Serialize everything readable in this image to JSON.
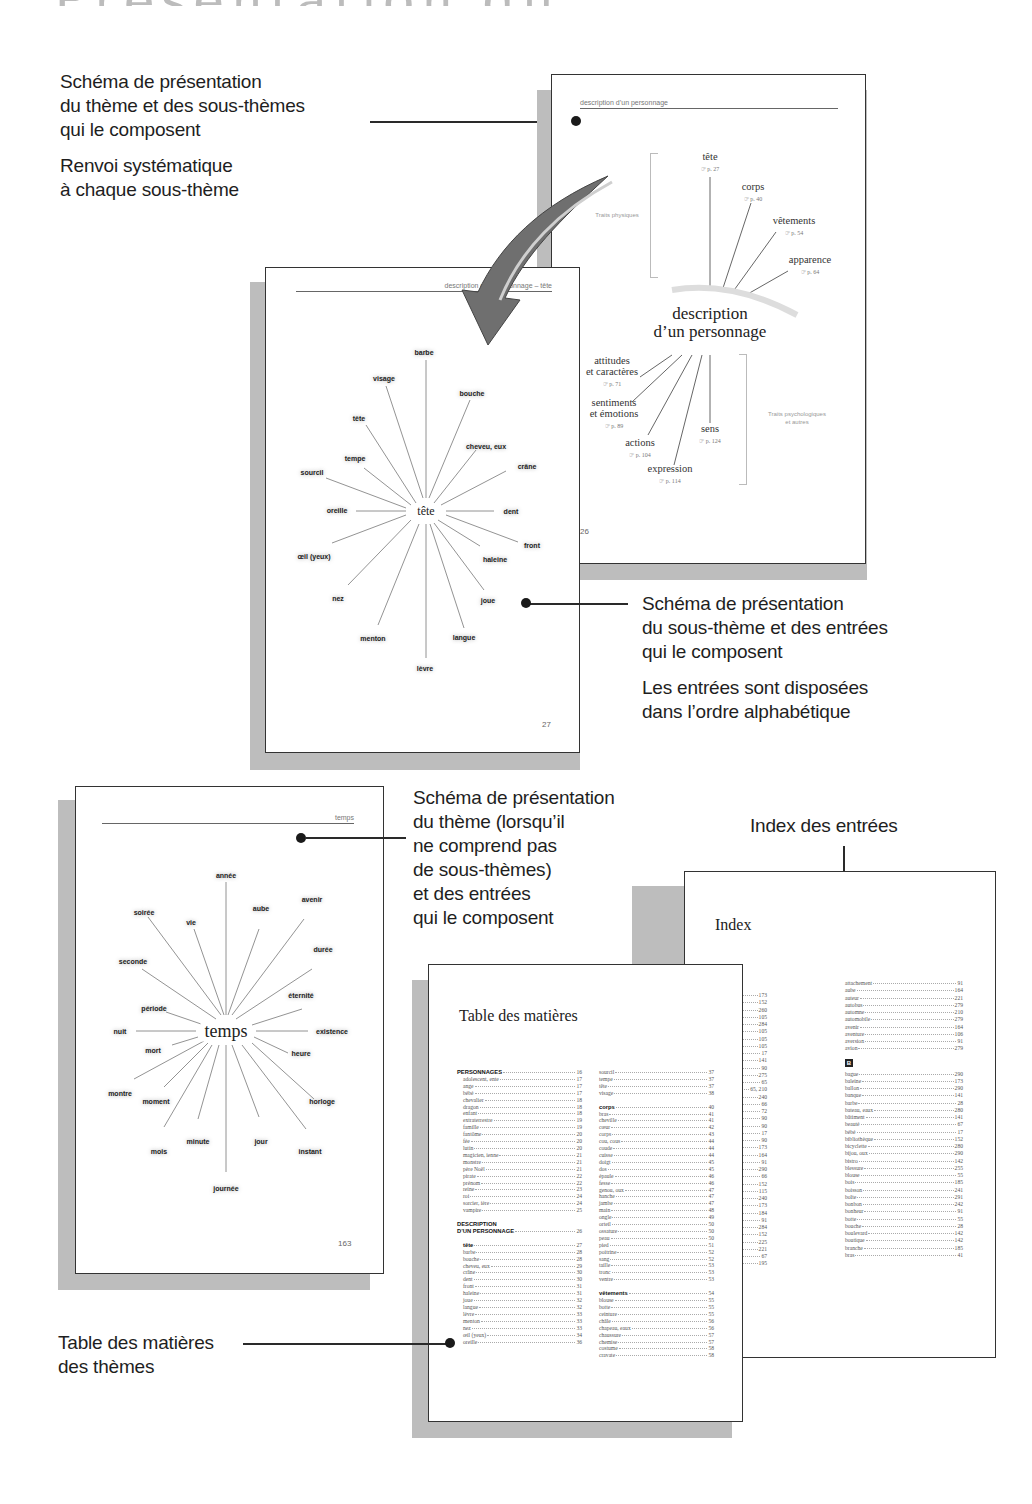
{
  "page_title": "Présentation du thésaurus",
  "captions": {
    "theme_schema": [
      "Schéma de présentation\ndu thème et des sous-thèmes\nqui le composent",
      "Renvoi systématique\nà chaque sous-thème"
    ],
    "subtheme_schema": [
      "Schéma de présentation\ndu sous-thème et des entrées\nqui le composent",
      "Les entrées sont disposées\ndans l’ordre alphabétique"
    ],
    "theme_no_sub": [
      "Schéma de présentation\ndu thème (lorsqu’il\nne comprend pas\nde sous-thèmes)\net des entrées\nqui le composent"
    ],
    "index": "Index des entrées",
    "toc": "Table des matières\ndes thèmes"
  },
  "page_26": {
    "running_head": "description d’un personnage",
    "folio": "26",
    "hub": [
      "description",
      "d’un personnage"
    ],
    "bracket_top": "Traits physiques",
    "bracket_bottom": "Traits psychologiques\net autres",
    "subthemes": [
      {
        "label": "tête",
        "ref": "☞ p. 27"
      },
      {
        "label": "corps",
        "ref": "☞ p. 40"
      },
      {
        "label": "vêtements",
        "ref": "☞ p. 54"
      },
      {
        "label": "apparence",
        "ref": "☞ p. 64"
      },
      {
        "label": "attitudes\net caractères",
        "ref": "☞ p. 71"
      },
      {
        "label": "sentiments\net émotions",
        "ref": "☞ p. 89"
      },
      {
        "label": "actions",
        "ref": "☞ p. 104"
      },
      {
        "label": "expression",
        "ref": "☞ p. 114"
      },
      {
        "label": "sens",
        "ref": "☞ p. 124"
      }
    ]
  },
  "page_27": {
    "running_head": "description d’un personnage – tête",
    "folio": "27",
    "hub": "tête",
    "entries": [
      "barbe",
      "bouche",
      "cheveu, eux",
      "crâne",
      "dent",
      "front",
      "haleine",
      "joue",
      "langue",
      "lèvre",
      "menton",
      "nez",
      "œil (yeux)",
      "oreille",
      "sourcil",
      "tempe",
      "tête",
      "visage"
    ]
  },
  "page_163": {
    "running_head": "temps",
    "folio": "163",
    "hub": "temps",
    "entries": [
      "année",
      "aube",
      "avenir",
      "durée",
      "éternité",
      "existence",
      "heure",
      "horloge",
      "instant",
      "jour",
      "journée",
      "minute",
      "mois",
      "moment",
      "montre",
      "mort",
      "nuit",
      "période",
      "seconde",
      "soirée",
      "vie"
    ]
  },
  "toc": {
    "title": "Table des matières",
    "col1": [
      {
        "label": "PERSONNAGES",
        "page": "16",
        "type": "section"
      },
      {
        "label": "adolescent, ente",
        "page": "17",
        "type": "indent"
      },
      {
        "label": "ange",
        "page": "17",
        "type": "indent"
      },
      {
        "label": "bébé",
        "page": "17",
        "type": "indent"
      },
      {
        "label": "chevalier",
        "page": "18",
        "type": "indent"
      },
      {
        "label": "dragon",
        "page": "18",
        "type": "indent"
      },
      {
        "label": "enfant",
        "page": "18",
        "type": "indent"
      },
      {
        "label": "extraterrestre",
        "page": "19",
        "type": "indent"
      },
      {
        "label": "famille",
        "page": "19",
        "type": "indent"
      },
      {
        "label": "fantôme",
        "page": "20",
        "type": "indent"
      },
      {
        "label": "fée",
        "page": "20",
        "type": "indent"
      },
      {
        "label": "lutin",
        "page": "20",
        "type": "indent"
      },
      {
        "label": "magicien, ienne",
        "page": "21",
        "type": "indent"
      },
      {
        "label": "monstre",
        "page": "21",
        "type": "indent"
      },
      {
        "label": "père Noël",
        "page": "21",
        "type": "indent"
      },
      {
        "label": "pirate",
        "page": "22",
        "type": "indent"
      },
      {
        "label": "prénom",
        "page": "22",
        "type": "indent"
      },
      {
        "label": "reine",
        "page": "23",
        "type": "indent"
      },
      {
        "label": "roi",
        "page": "24",
        "type": "indent"
      },
      {
        "label": "sorcier, ière",
        "page": "24",
        "type": "indent"
      },
      {
        "label": "vampire",
        "page": "25",
        "type": "indent"
      },
      {
        "type": "gap"
      },
      {
        "label": "DESCRIPTION",
        "page": "",
        "type": "section-head"
      },
      {
        "label": "D’UN PERSONNAGE",
        "page": "26",
        "type": "section"
      },
      {
        "type": "gap"
      },
      {
        "label": "tête",
        "page": "27",
        "type": "section indent"
      },
      {
        "label": "barbe",
        "page": "28",
        "type": "indent"
      },
      {
        "label": "bouche",
        "page": "28",
        "type": "indent"
      },
      {
        "label": "cheveu, eux",
        "page": "29",
        "type": "indent"
      },
      {
        "label": "crâne",
        "page": "30",
        "type": "indent"
      },
      {
        "label": "dent",
        "page": "30",
        "type": "indent"
      },
      {
        "label": "front",
        "page": "31",
        "type": "indent"
      },
      {
        "label": "haleine",
        "page": "31",
        "type": "indent"
      },
      {
        "label": "joue",
        "page": "32",
        "type": "indent"
      },
      {
        "label": "langue",
        "page": "32",
        "type": "indent"
      },
      {
        "label": "lèvre",
        "page": "33",
        "type": "indent"
      },
      {
        "label": "menton",
        "page": "33",
        "type": "indent"
      },
      {
        "label": "nez",
        "page": "33",
        "type": "indent"
      },
      {
        "label": "œil (yeux)",
        "page": "34",
        "type": "indent"
      },
      {
        "label": "oreille",
        "page": "36",
        "type": "indent"
      }
    ],
    "col2": [
      {
        "label": "sourcil",
        "page": "37"
      },
      {
        "label": "tempe",
        "page": "37"
      },
      {
        "label": "tête",
        "page": "37"
      },
      {
        "label": "visage",
        "page": "38"
      },
      {
        "type": "gap"
      },
      {
        "label": "corps",
        "page": "40",
        "type": "section"
      },
      {
        "label": "bras",
        "page": "41"
      },
      {
        "label": "cheville",
        "page": "41"
      },
      {
        "label": "cœur",
        "page": "42"
      },
      {
        "label": "corps",
        "page": "43"
      },
      {
        "label": "cou, cous",
        "page": "44"
      },
      {
        "label": "coude",
        "page": "44"
      },
      {
        "label": "cuisse",
        "page": "44"
      },
      {
        "label": "doigt",
        "page": "45"
      },
      {
        "label": "dos",
        "page": "45"
      },
      {
        "label": "épaule",
        "page": "46"
      },
      {
        "label": "fesse",
        "page": "46"
      },
      {
        "label": "genou, oux",
        "page": "47"
      },
      {
        "label": "hanche",
        "page": "47"
      },
      {
        "label": "jambe",
        "page": "47"
      },
      {
        "label": "main",
        "page": "48"
      },
      {
        "label": "ongle",
        "page": "49"
      },
      {
        "label": "orteil",
        "page": "50"
      },
      {
        "label": "ossature",
        "page": "50"
      },
      {
        "label": "peau",
        "page": "50"
      },
      {
        "label": "pied",
        "page": "51"
      },
      {
        "label": "poitrine",
        "page": "52"
      },
      {
        "label": "sang",
        "page": "52"
      },
      {
        "label": "taille",
        "page": "53"
      },
      {
        "label": "tronc",
        "page": "53"
      },
      {
        "label": "ventre",
        "page": "53"
      },
      {
        "type": "gap"
      },
      {
        "label": "vêtements",
        "page": "54",
        "type": "section"
      },
      {
        "label": "blouse",
        "page": "55"
      },
      {
        "label": "botte",
        "page": "55"
      },
      {
        "label": "ceinture",
        "page": "55"
      },
      {
        "label": "châle",
        "page": "56"
      },
      {
        "label": "chapeau, eaux",
        "page": "56"
      },
      {
        "label": "chaussure",
        "page": "57"
      },
      {
        "label": "chemise",
        "page": "57"
      },
      {
        "label": "costume",
        "page": "58"
      },
      {
        "label": "cravate",
        "page": "58"
      }
    ]
  },
  "index": {
    "title": "Index",
    "col1_partial": [
      {
        "label": "",
        "page": "173"
      },
      {
        "label": "",
        "page": "152"
      },
      {
        "label": "",
        "page": "260"
      },
      {
        "label": "",
        "page": "105"
      },
      {
        "label": "",
        "page": "284"
      },
      {
        "label": "",
        "page": "105"
      },
      {
        "label": "",
        "page": "105"
      },
      {
        "label": "",
        "page": "105"
      },
      {
        "label": "t, ente",
        "page": "17"
      },
      {
        "label": "",
        "page": "141"
      },
      {
        "label": "",
        "page": "90"
      },
      {
        "label": "",
        "page": "275"
      },
      {
        "label": "",
        "page": "65"
      },
      {
        "label": "",
        "page": "65, 210"
      },
      {
        "label": "",
        "page": "240"
      },
      {
        "label": "",
        "page": "66"
      },
      {
        "label": "",
        "page": "72"
      },
      {
        "label": "",
        "page": "90"
      },
      {
        "label": "",
        "page": "90"
      },
      {
        "label": "",
        "page": "17"
      },
      {
        "label": "",
        "page": "90"
      },
      {
        "label": "x",
        "page": "173"
      },
      {
        "label": "",
        "page": "164"
      },
      {
        "label": "",
        "page": "91"
      },
      {
        "label": "",
        "page": "290"
      },
      {
        "label": "e",
        "page": "66"
      },
      {
        "label": "ent",
        "page": "152"
      },
      {
        "label": "",
        "page": "115"
      },
      {
        "label": "",
        "page": "240"
      },
      {
        "label": "",
        "page": "173"
      },
      {
        "label": "",
        "page": "184"
      },
      {
        "label": "",
        "page": "91"
      },
      {
        "label": "",
        "page": "284"
      },
      {
        "label": "",
        "page": "152"
      },
      {
        "label": "",
        "page": "225"
      },
      {
        "label": "",
        "page": "221"
      },
      {
        "label": "",
        "page": "67"
      },
      {
        "label": "",
        "page": "195"
      }
    ],
    "col2_a": [
      {
        "label": "attachement",
        "page": "91"
      },
      {
        "label": "aube",
        "page": "164"
      },
      {
        "label": "auteur",
        "page": "221"
      },
      {
        "label": "autobus",
        "page": "279"
      },
      {
        "label": "automne",
        "page": "210"
      },
      {
        "label": "automobile",
        "page": "279"
      },
      {
        "label": "avenir",
        "page": "164"
      },
      {
        "label": "aventure",
        "page": "106"
      },
      {
        "label": "aversion",
        "page": "91"
      },
      {
        "label": "avion",
        "page": "279"
      }
    ],
    "letter_b": "B",
    "col2_b": [
      {
        "label": "bague",
        "page": "290"
      },
      {
        "label": "baleine",
        "page": "173"
      },
      {
        "label": "ballon",
        "page": "290"
      },
      {
        "label": "banque",
        "page": "141"
      },
      {
        "label": "barbe",
        "page": "28"
      },
      {
        "label": "bateau, eaux",
        "page": "280"
      },
      {
        "label": "bâtiment",
        "page": "141"
      },
      {
        "label": "beauté",
        "page": "67"
      },
      {
        "label": "bébé",
        "page": "17"
      },
      {
        "label": "bibliothèque",
        "page": "152"
      },
      {
        "label": "bicyclette",
        "page": "280"
      },
      {
        "label": "bijou, oux",
        "page": "290"
      },
      {
        "label": "bistro",
        "page": "142"
      },
      {
        "label": "blessure",
        "page": "255"
      },
      {
        "label": "blouse",
        "page": "55"
      },
      {
        "label": "bois",
        "page": "185"
      },
      {
        "label": "boisson",
        "page": "241"
      },
      {
        "label": "boîte",
        "page": "291"
      },
      {
        "label": "bonbon",
        "page": "242"
      },
      {
        "label": "bonheur",
        "page": "91"
      },
      {
        "label": "botte",
        "page": "55"
      },
      {
        "label": "bouche",
        "page": "28"
      },
      {
        "label": "boulevard",
        "page": "142"
      },
      {
        "label": "boutique",
        "page": "142"
      },
      {
        "label": "branche",
        "page": "185"
      },
      {
        "label": "bras",
        "page": "41"
      }
    ]
  },
  "colors": {
    "ink": "#1a1a1a",
    "page_shadow": "#bdbdbd",
    "arrow_fill": "#6f6f6f"
  }
}
